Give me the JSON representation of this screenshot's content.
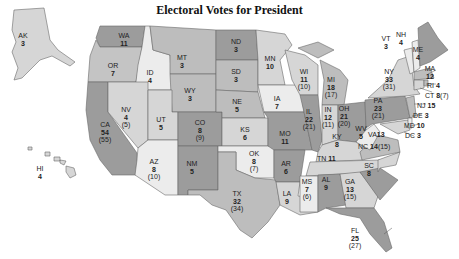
{
  "title": "Electoral Votes for President",
  "colors": {
    "dark": "#9c9c9c",
    "medium": "#bdbdbd",
    "light": "#d6d6d6",
    "pale": "#ececec",
    "border": "#6a6a6a",
    "background": "#ffffff"
  },
  "states": [
    {
      "abbr": "AK",
      "votes": "3",
      "prior": ""
    },
    {
      "abbr": "HI",
      "votes": "4",
      "prior": ""
    },
    {
      "abbr": "WA",
      "votes": "11",
      "prior": ""
    },
    {
      "abbr": "OR",
      "votes": "7",
      "prior": ""
    },
    {
      "abbr": "CA",
      "votes": "54",
      "prior": "(55)"
    },
    {
      "abbr": "ID",
      "votes": "4",
      "prior": ""
    },
    {
      "abbr": "NV",
      "votes": "4",
      "prior": "(5)"
    },
    {
      "abbr": "MT",
      "votes": "3",
      "prior": ""
    },
    {
      "abbr": "WY",
      "votes": "3",
      "prior": ""
    },
    {
      "abbr": "UT",
      "votes": "5",
      "prior": ""
    },
    {
      "abbr": "AZ",
      "votes": "8",
      "prior": "(10)"
    },
    {
      "abbr": "CO",
      "votes": "8",
      "prior": "(9)"
    },
    {
      "abbr": "NM",
      "votes": "5",
      "prior": ""
    },
    {
      "abbr": "ND",
      "votes": "3",
      "prior": ""
    },
    {
      "abbr": "SD",
      "votes": "3",
      "prior": ""
    },
    {
      "abbr": "NE",
      "votes": "5",
      "prior": ""
    },
    {
      "abbr": "KS",
      "votes": "6",
      "prior": ""
    },
    {
      "abbr": "OK",
      "votes": "8",
      "prior": "(7)"
    },
    {
      "abbr": "TX",
      "votes": "32",
      "prior": "(34)"
    },
    {
      "abbr": "MN",
      "votes": "10",
      "prior": ""
    },
    {
      "abbr": "IA",
      "votes": "7",
      "prior": ""
    },
    {
      "abbr": "MO",
      "votes": "11",
      "prior": ""
    },
    {
      "abbr": "AR",
      "votes": "6",
      "prior": ""
    },
    {
      "abbr": "LA",
      "votes": "9",
      "prior": ""
    },
    {
      "abbr": "WI",
      "votes": "11",
      "prior": "(10)"
    },
    {
      "abbr": "IL",
      "votes": "22",
      "prior": "(21)"
    },
    {
      "abbr": "MI",
      "votes": "18",
      "prior": "(17)"
    },
    {
      "abbr": "IN",
      "votes": "12",
      "prior": "(11)"
    },
    {
      "abbr": "OH",
      "votes": "21",
      "prior": "(20)"
    },
    {
      "abbr": "KY",
      "votes": "8",
      "prior": ""
    },
    {
      "abbr": "TN",
      "votes": "11",
      "prior": ""
    },
    {
      "abbr": "MS",
      "votes": "7",
      "prior": "(6)"
    },
    {
      "abbr": "AL",
      "votes": "9",
      "prior": ""
    },
    {
      "abbr": "GA",
      "votes": "13",
      "prior": "(15)"
    },
    {
      "abbr": "FL",
      "votes": "25",
      "prior": "(27)"
    },
    {
      "abbr": "SC",
      "votes": "8",
      "prior": ""
    },
    {
      "abbr": "NC",
      "votes": "14",
      "prior": "(15)"
    },
    {
      "abbr": "VA",
      "votes": "13",
      "prior": ""
    },
    {
      "abbr": "WV",
      "votes": "5",
      "prior": ""
    },
    {
      "abbr": "PA",
      "votes": "23",
      "prior": "(21)"
    },
    {
      "abbr": "NY",
      "votes": "33",
      "prior": "(31)"
    },
    {
      "abbr": "VT",
      "votes": "3",
      "prior": ""
    },
    {
      "abbr": "NH",
      "votes": "4",
      "prior": ""
    },
    {
      "abbr": "ME",
      "votes": "4",
      "prior": ""
    },
    {
      "abbr": "MA",
      "votes": "12",
      "prior": ""
    },
    {
      "abbr": "RI",
      "votes": "4",
      "prior": ""
    },
    {
      "abbr": "CT",
      "votes": "8",
      "prior": "(7)"
    },
    {
      "abbr": "NJ",
      "votes": "15",
      "prior": ""
    },
    {
      "abbr": "DE",
      "votes": "3",
      "prior": ""
    },
    {
      "abbr": "MD",
      "votes": "10",
      "prior": ""
    },
    {
      "abbr": "DC",
      "votes": "3",
      "prior": ""
    }
  ]
}
